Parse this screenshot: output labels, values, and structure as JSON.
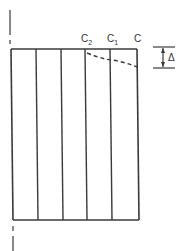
{
  "diagram": {
    "colors": {
      "line": "#3a3a3a",
      "background": "#ffffff"
    },
    "labels": {
      "c2": {
        "base": "C",
        "sub": "2"
      },
      "c1": {
        "base": "C",
        "sub": "1"
      },
      "c": {
        "base": "C",
        "sub": ""
      },
      "delta": "Δ"
    },
    "strips": 5
  }
}
